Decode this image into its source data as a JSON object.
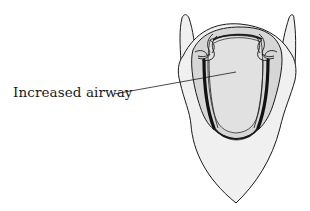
{
  "figure": {
    "label": "Increased airway"
  },
  "colors": {
    "outline": "#1a1a1a",
    "outer_fill": "#f0f0f0",
    "inner_ring_fill": "#d6d6d6",
    "airway_fill": "#dedede",
    "background": "#ffffff"
  }
}
